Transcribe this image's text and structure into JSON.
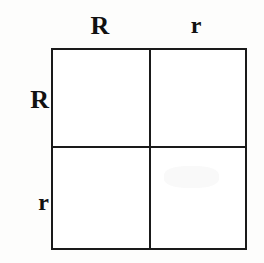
{
  "figure": {
    "type": "monohybrid-punnett-square",
    "colors": {
      "line": "#1a1a1a",
      "cell_fill": "#ffffff",
      "background": "#fdfdfc",
      "text": "#111111"
    }
  },
  "axes": {
    "top_label_1": "R",
    "top_label_2": "r",
    "left_label_1": "R",
    "left_label_2": "r"
  },
  "grid": {
    "columns": [
      "R",
      "r"
    ],
    "rows": [
      "R",
      "r"
    ],
    "cells": [
      {
        "id": "cell-top-left",
        "row": "R",
        "column": "R",
        "value": ""
      },
      {
        "id": "cell-top-right",
        "row": "R",
        "column": "r",
        "value": ""
      },
      {
        "id": "cell-bottom-left",
        "row": "r",
        "column": "R",
        "value": ""
      },
      {
        "id": "cell-bottom-right",
        "row": "r",
        "column": "r",
        "value": ""
      }
    ]
  }
}
